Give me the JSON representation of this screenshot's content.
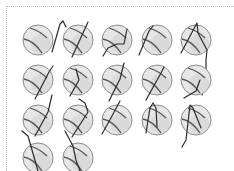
{
  "figure": {
    "border_color": "#b9b9b9",
    "ball_radius": 15,
    "balls": [
      {
        "cx": 38,
        "cy": 40,
        "stroke": "M52 52 L60 24 L63 21 L66 27"
      },
      {
        "cx": 78,
        "cy": 40,
        "stroke": "M72 57 L88 22"
      },
      {
        "cx": 117,
        "cy": 40,
        "stroke": "M103 56 L108 48 L117 44 L124 44 L127 29"
      },
      {
        "cx": 157,
        "cy": 40,
        "stroke": "M139 55 L149 31 L153 26"
      },
      {
        "cx": 196,
        "cy": 40,
        "stroke": "M181 53 L197 23 L198 33 L207 50 L206 60 L206 70 L206 80 L202 95"
      },
      {
        "cx": 38,
        "cy": 80,
        "stroke": "M35 99 L49 72 L53 66"
      },
      {
        "cx": 78,
        "cy": 80,
        "stroke": "M70 96 L79 80 L76 69"
      },
      {
        "cx": 117,
        "cy": 80,
        "stroke": "M109 101 L120 79 L124 63"
      },
      {
        "cx": 157,
        "cy": 80,
        "stroke": "M146 100 L161 73 L164 67"
      },
      {
        "cx": 196,
        "cy": 80,
        "stroke": "M184 98 L196 91 L200 80"
      },
      {
        "cx": 38,
        "cy": 120,
        "stroke": "M35 136 L48 112 L52 95"
      },
      {
        "cx": 78,
        "cy": 120,
        "stroke": "M72 137 L88 112 L85 103 L79 99"
      },
      {
        "cx": 117,
        "cy": 120,
        "stroke": "M102 134 L112 116 L120 101"
      },
      {
        "cx": 157,
        "cy": 120,
        "stroke": "M146 133 L150 108 L153 103 L156 108 L157 127"
      },
      {
        "cx": 196,
        "cy": 120,
        "stroke": "M182 147 L186 140 L190 105 L193 108 L201 128"
      },
      {
        "cx": 38,
        "cy": 158,
        "stroke": "M22 131 L28 136 L32 150 L38 171"
      },
      {
        "cx": 78,
        "cy": 158,
        "stroke": "M65 131 L73 146 L76 160 L80 171"
      }
    ]
  }
}
